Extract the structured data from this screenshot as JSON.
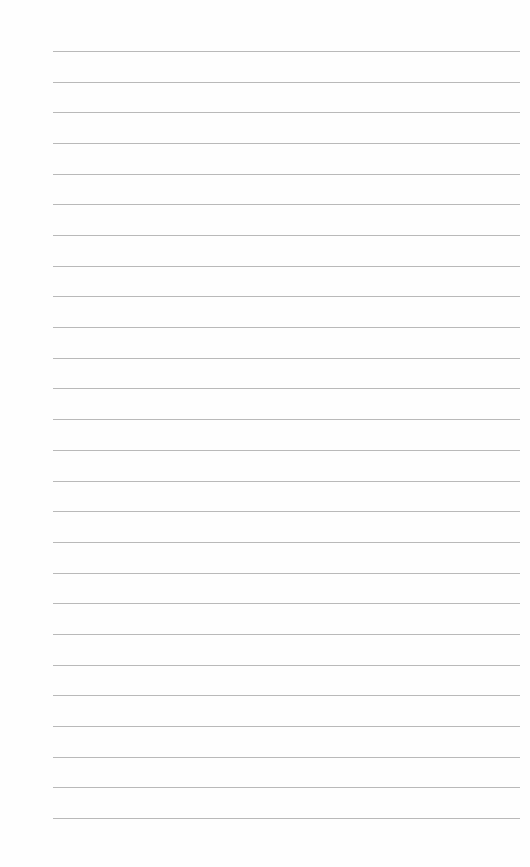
{
  "page": {
    "type": "lined-paper",
    "background_color": "#fefefe",
    "line_color": "#b9b9b9",
    "line_count": 26,
    "first_line_y": 51,
    "line_spacing": 30.68,
    "line_left": 53,
    "line_right": 520,
    "text": ""
  }
}
